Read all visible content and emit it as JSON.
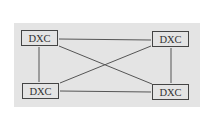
{
  "diagram": {
    "nodes": [
      {
        "id": "tl",
        "label": "DXC"
      },
      {
        "id": "tr",
        "label": "DXC"
      },
      {
        "id": "bl",
        "label": "DXC"
      },
      {
        "id": "br",
        "label": "DXC"
      }
    ],
    "edges": [
      [
        "tl",
        "tr"
      ],
      [
        "tl",
        "bl"
      ],
      [
        "tl",
        "br"
      ],
      [
        "tr",
        "bl"
      ],
      [
        "tr",
        "br"
      ],
      [
        "bl",
        "br"
      ]
    ],
    "colors": {
      "panel": "#e4e4e4",
      "stroke": "#444444",
      "text": "#333333"
    }
  }
}
